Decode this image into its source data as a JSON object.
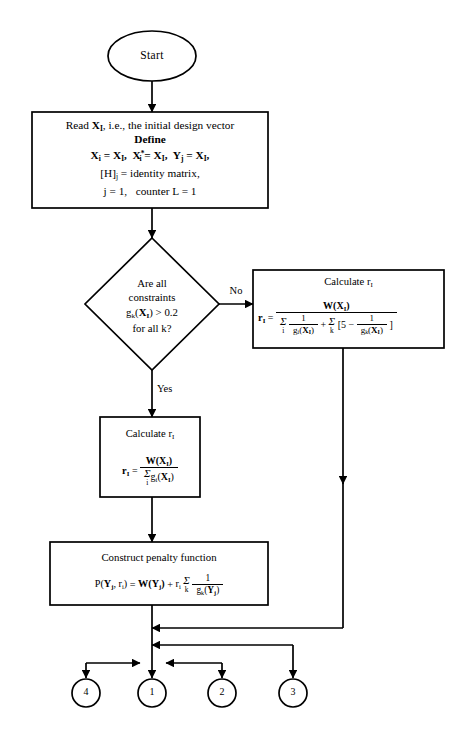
{
  "diagram": {
    "ink_color": "#000000",
    "background": "#ffffff"
  },
  "nodes": {
    "start": {
      "shape": "oval",
      "label": "Start"
    },
    "read_box": {
      "shape": "rectangle",
      "line1_a": "Read ",
      "line1_b": "X",
      "line1_b_sub": "I",
      "line1_c": ", i.e., the initial design vector",
      "line2": "Define",
      "line3_1_lhs": "X",
      "line3_1_lhs_sub": "i",
      "line3_1_rhs": "X",
      "line3_1_rhs_sub": "I",
      "line3_2_lhs": "X",
      "line3_2_lhs_sub": "i",
      "line3_2_lhs_sup": "*",
      "line3_2_rhs": "X",
      "line3_2_rhs_sub": "I",
      "line3_3_lhs": "Y",
      "line3_3_lhs_sub": "j",
      "line3_3_rhs": "X",
      "line3_3_rhs_sub": "I",
      "line4_lhs": "[H]",
      "line4_lhs_sub": "j",
      "line4_rhs": "identity matrix,",
      "line5_a": "j = 1,",
      "line5_b": "counter L = 1",
      "eq": "=",
      "comma": ","
    },
    "decision": {
      "shape": "diamond",
      "line1": "Are all",
      "line2": "constraints",
      "line3_fn": "g",
      "line3_fn_sub": "k",
      "line3_arg_open": "(",
      "line3_arg": "X",
      "line3_arg_sub": "I",
      "line3_arg_close": ")",
      "line3_rel": "> 0.2",
      "line4": "for all k?",
      "yes_label": "Yes",
      "no_label": "No"
    },
    "calc_right": {
      "shape": "rectangle",
      "heading_a": "Calculate r",
      "heading_sub": "I",
      "eq_lhs": "r",
      "eq_lhs_sub": "I",
      "eq_sign": "=",
      "numerator_fn": "W",
      "numerator_open": "(",
      "numerator_arg": "X",
      "numerator_arg_sub": "I",
      "numerator_close": ")",
      "den_sum1_symbol": "Σ",
      "den_sum1_index": "i",
      "den_term1_num": "1",
      "den_term1_den_fn": "g",
      "den_term1_den_sub": "i",
      "den_term1_den_open": "(",
      "den_term1_den_arg": "X",
      "den_term1_den_arg_sub": "I",
      "den_term1_den_close": ")",
      "den_plus": "+",
      "den_sum2_symbol": "Σ",
      "den_sum2_index": "k",
      "den_bracket_open": "[5",
      "den_minus": "−",
      "den_term2_num": "1",
      "den_term2_den_fn": "g",
      "den_term2_den_sub": "k",
      "den_term2_den_open": "(",
      "den_term2_den_arg": "X",
      "den_term2_den_arg_sub": "I",
      "den_term2_den_close": ")",
      "den_bracket_close": "]"
    },
    "calc_mid": {
      "shape": "rectangle",
      "heading_a": "Calculate r",
      "heading_sub": "I",
      "eq_lhs": "r",
      "eq_lhs_sub": "I",
      "eq_sign": "=",
      "numerator_fn": "W",
      "numerator_open": "(",
      "numerator_arg": "X",
      "numerator_arg_sub": "I",
      "numerator_close": ")",
      "den_sum_symbol": "Σ",
      "den_sum_index": "i",
      "den_fn": "g",
      "den_fn_sub": "i",
      "den_open": "(",
      "den_arg": "X",
      "den_arg_sub": "I",
      "den_close": ")"
    },
    "penalty": {
      "shape": "rectangle",
      "heading": "Construct penalty function",
      "eq_p": "P",
      "eq_open": "(",
      "eq_y": "Y",
      "eq_y_sub": "j",
      "eq_comma": ", ",
      "eq_r": "r",
      "eq_r_sub": "i",
      "eq_close": ")",
      "eq_sign": "=",
      "rhs_w": "W",
      "rhs_w_open": "(",
      "rhs_w_arg": "Y",
      "rhs_w_arg_sub": "j",
      "rhs_w_close": ")",
      "rhs_plus": "+",
      "rhs_r": "r",
      "rhs_r_sub": "i",
      "rhs_sum_symbol": "Σ",
      "rhs_sum_index": "k",
      "rhs_frac_num": "1",
      "rhs_frac_den_fn": "g",
      "rhs_frac_den_sub": "k",
      "rhs_frac_den_open": "(",
      "rhs_frac_den_arg": "Y",
      "rhs_frac_den_arg_sub": "j",
      "rhs_frac_den_close": ")"
    }
  },
  "connectors": {
    "circles": [
      {
        "id": "connector-4",
        "label": "4",
        "cx": 86,
        "cy": 693
      },
      {
        "id": "connector-1",
        "label": "1",
        "cx": 152,
        "cy": 693
      },
      {
        "id": "connector-2",
        "label": "2",
        "cx": 222,
        "cy": 693
      },
      {
        "id": "connector-3",
        "label": "3",
        "cx": 293,
        "cy": 693
      }
    ]
  }
}
